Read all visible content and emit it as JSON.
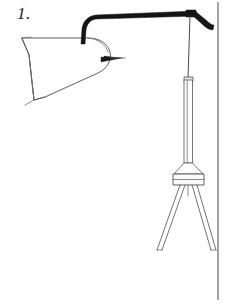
{
  "figure": {
    "label": "1.",
    "title": "1.",
    "caption_number": "1",
    "drawing_type": "line-drawing",
    "background_color": "#ffffff",
    "ink_color": "#141416",
    "outline_color": "#59595c",
    "border_color": "#58585b"
  },
  "canvas": {
    "width": "235",
    "height": "305"
  },
  "parts": {
    "label": "1.",
    "lamp_shade": "lamp-shade",
    "support_arm": "support-arm",
    "arm_tip": "arm-tip",
    "socket_spike": "socket-spike",
    "suspension_wire": "suspension-wire",
    "vertical_tube": "vertical-tube",
    "tube_collar": "tube-collar",
    "cone_hub": "cone-hub",
    "hub_band": "hub-band",
    "left_leg": "left-leg",
    "right_leg": "right-leg",
    "page_border": "page-border"
  }
}
